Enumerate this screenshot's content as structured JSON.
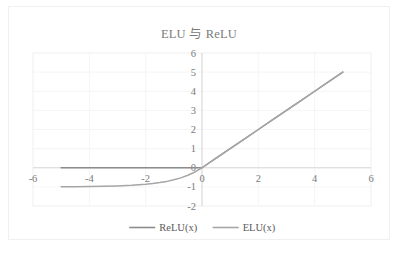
{
  "chart_data": {
    "type": "line",
    "title": "ELU 与 ReLU",
    "xlabel": "",
    "ylabel": "",
    "xlim": [
      -6,
      6
    ],
    "ylim": [
      -2,
      6
    ],
    "xticks": [
      "-6",
      "-4",
      "-2",
      "0",
      "2",
      "4",
      "6"
    ],
    "xtick_values": [
      -6,
      -4,
      -2,
      0,
      2,
      4,
      6
    ],
    "yticks": [
      "-2",
      "-1",
      "0",
      "1",
      "2",
      "3",
      "4",
      "5",
      "6"
    ],
    "ytick_values": [
      -2,
      -1,
      0,
      1,
      2,
      3,
      4,
      5,
      6
    ],
    "grid": true,
    "grid_horizontal": true,
    "grid_vertical": true,
    "legend_position": "bottom-center",
    "x": [
      -5,
      -4.5,
      -4,
      -3.5,
      -3,
      -2.5,
      -2,
      -1.75,
      -1.5,
      -1.25,
      -1,
      -0.75,
      -0.5,
      -0.25,
      0,
      0.5,
      1,
      1.5,
      2,
      2.5,
      3,
      3.5,
      4,
      4.5,
      5
    ],
    "series": [
      {
        "name": "ReLU(x)",
        "color": "#8c8c8c",
        "values": [
          0,
          0,
          0,
          0,
          0,
          0,
          0,
          0,
          0,
          0,
          0,
          0,
          0,
          0,
          0,
          0.5,
          1,
          1.5,
          2,
          2.5,
          3,
          3.5,
          4,
          4.5,
          5
        ]
      },
      {
        "name": "ELU(x)",
        "color": "#a6a6a6",
        "values": [
          -0.993,
          -0.989,
          -0.982,
          -0.97,
          -0.95,
          -0.918,
          -0.865,
          -0.826,
          -0.777,
          -0.713,
          -0.632,
          -0.528,
          -0.393,
          -0.221,
          0,
          0.5,
          1,
          1.5,
          2,
          2.5,
          3,
          3.5,
          4,
          4.5,
          5
        ]
      }
    ]
  },
  "legend": {
    "items": [
      {
        "label": "ReLU(x)",
        "color": "#8c8c8c"
      },
      {
        "label": "ELU(x)",
        "color": "#a6a6a6"
      }
    ]
  },
  "colors": {
    "title": "#7b7b7b",
    "tick": "#7b7b7b",
    "grid": "#f2f2f2",
    "axis": "#d4d4d4",
    "frame_border": "#f0f0f0",
    "background": "#ffffff"
  }
}
